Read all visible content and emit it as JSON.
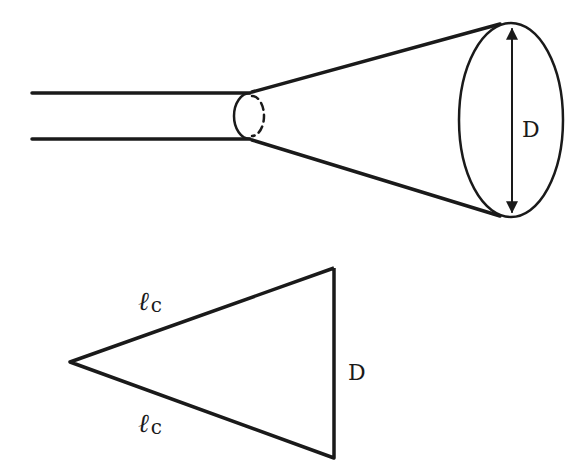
{
  "diagram": {
    "colors": {
      "stroke": "#1a1a1a",
      "background": "#ffffff"
    },
    "horn": {
      "diameter_label": "D"
    },
    "triangle": {
      "slant_label_top": "ℓ",
      "slant_label_top_sub": "c",
      "slant_label_bottom": "ℓ",
      "slant_label_bottom_sub": "c",
      "base_label": "D"
    }
  }
}
